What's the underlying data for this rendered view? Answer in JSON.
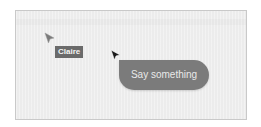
{
  "canvas": {
    "background_color": "#ececec",
    "border_color": "#c9c9c9"
  },
  "collaborator": {
    "name": "Claire",
    "cursor_color": "#7a7a7a",
    "tag_color": "#6a6a6a"
  },
  "local_user": {
    "cursor_color": "#1a1a1a",
    "chat_bubble": {
      "placeholder": "Say something",
      "value": "",
      "color": "#7b7b7b"
    }
  },
  "icons": {
    "collaborator_cursor": "arrow-cursor-icon",
    "local_cursor": "arrow-cursor-icon"
  }
}
